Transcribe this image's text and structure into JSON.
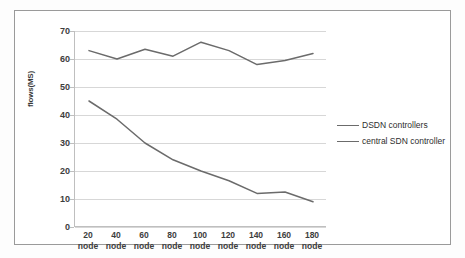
{
  "chart_data": {
    "type": "line",
    "title": "",
    "xlabel": "",
    "ylabel": "flows(MS)",
    "ylim": [
      0,
      70
    ],
    "yticks": [
      0,
      10,
      20,
      30,
      40,
      50,
      60,
      70
    ],
    "grid": true,
    "legend_position": "right",
    "categories": [
      "20 node",
      "40 node",
      "60 node",
      "80 node",
      "100 node",
      "120 node",
      "140 node",
      "160 node",
      "180 node"
    ],
    "x": [
      20,
      40,
      60,
      80,
      100,
      120,
      140,
      160,
      180
    ],
    "series": [
      {
        "name": "DSDN controllers",
        "color": "#6b6b6b",
        "values": [
          63,
          60,
          63.5,
          61,
          66,
          63,
          58,
          59.5,
          62
        ]
      },
      {
        "name": "central SDN controller",
        "color": "#6b6b6b",
        "values": [
          45,
          38.5,
          30,
          24,
          20,
          16.5,
          12,
          12.5,
          9
        ]
      }
    ]
  },
  "axis": {
    "y_tick_labels": [
      "70",
      "60",
      "50",
      "40",
      "30",
      "20",
      "10",
      "0"
    ],
    "y_title": "flows(MS)",
    "x_tick_numbers": [
      "20",
      "40",
      "60",
      "80",
      "100",
      "120",
      "140",
      "160",
      "180"
    ],
    "x_tick_unit": "node"
  },
  "legend": {
    "items": [
      {
        "label": "DSDN controllers"
      },
      {
        "label": "central SDN controller"
      }
    ]
  },
  "colors": {
    "series_line": "#6b6b6b",
    "grid": "#d7d7d7",
    "axis": "#bfbfbf",
    "frame": "#9a9a9a",
    "text": "#3d3d3d"
  }
}
